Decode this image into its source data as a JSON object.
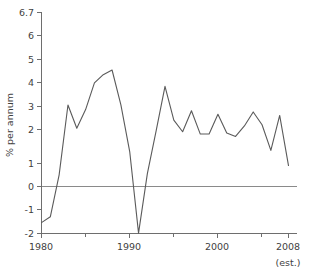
{
  "chart_data": {
    "type": "line",
    "title": "",
    "subtitle": "",
    "xlabel": "",
    "ylabel": "% per annum",
    "xlim": [
      1980,
      2008
    ],
    "ylim": [
      -2,
      6.7
    ],
    "grid": false,
    "legend": null,
    "zero_line": true,
    "x_tick_labels": [
      "1980",
      "1990",
      "2000",
      "2008"
    ],
    "x_tick_values": [
      1980,
      1990,
      2000,
      2008
    ],
    "x_minor_ticks": [
      1985,
      1995,
      2005
    ],
    "y_tick_labels": [
      "6.7",
      "6",
      "5",
      "4",
      "3",
      "2",
      "1",
      "0",
      "-1",
      "-2"
    ],
    "y_tick_values": [
      6.7,
      6,
      5,
      4,
      3,
      2,
      1,
      0,
      -1,
      -2
    ],
    "annotations": [
      {
        "text": "(est.)",
        "x": 2008,
        "position": "below-axis-right"
      }
    ],
    "x": [
      1980,
      1981,
      1982,
      1983,
      1984,
      1985,
      1986,
      1987,
      1988,
      1989,
      1990,
      1991,
      1992,
      1993,
      1994,
      1995,
      1996,
      1997,
      1998,
      1999,
      2000,
      2001,
      2002,
      2003,
      2004,
      2005,
      2006,
      2007,
      2008
    ],
    "values": [
      -1.55,
      -1.3,
      0.5,
      3.5,
      2.5,
      3.3,
      4.45,
      4.8,
      5.0,
      3.5,
      1.5,
      -2.0,
      0.55,
      2.4,
      4.3,
      2.85,
      2.35,
      3.25,
      2.25,
      2.25,
      3.1,
      2.3,
      2.15,
      2.6,
      3.2,
      2.65,
      1.55,
      3.05,
      0.9
    ],
    "series": [
      {
        "name": "% per annum",
        "color": "#5a5a5a",
        "values": [
          -1.55,
          -1.3,
          0.5,
          3.5,
          2.5,
          3.3,
          4.45,
          4.8,
          5.0,
          3.5,
          1.5,
          -2.0,
          0.55,
          2.4,
          4.3,
          2.85,
          2.35,
          3.25,
          2.25,
          2.25,
          3.1,
          2.3,
          2.15,
          2.6,
          3.2,
          2.65,
          1.55,
          3.05,
          0.9
        ]
      }
    ]
  },
  "axis": {
    "y_title": "% per annum",
    "y_labels": {
      "t0": "6.7",
      "t1": "6",
      "t2": "5",
      "t3": "4",
      "t4": "3",
      "t5": "2",
      "t6": "1",
      "t7": "0",
      "t8": "-1",
      "t9": "-2"
    },
    "x_labels": {
      "t0": "1980",
      "t1": "1990",
      "t2": "2000",
      "t3": "2008"
    },
    "est_note": "(est.)"
  },
  "colors": {
    "line": "#5a5a5a",
    "axis": "#6e6e6e",
    "zero_rule": "#8a8a8a",
    "text": "#3f3f3f",
    "background": "#ffffff"
  }
}
